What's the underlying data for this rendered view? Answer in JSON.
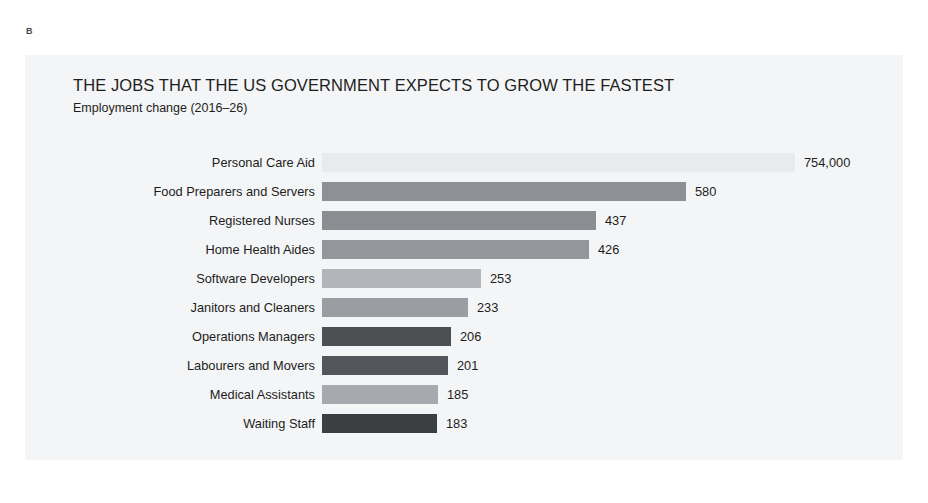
{
  "figure": {
    "letter": "B"
  },
  "chart_data": {
    "type": "bar",
    "orientation": "horizontal",
    "title": "THE JOBS THAT THE US GOVERNMENT EXPECTS TO GROW THE FASTEST",
    "subtitle": "Employment change (2016–26)",
    "xlabel": "",
    "ylabel": "",
    "grid": false,
    "legend": "none",
    "value_unit": "thousands of jobs",
    "xlim": [
      0,
      754
    ],
    "categories": [
      "Personal Care Aid",
      "Food Preparers and Servers",
      "Registered Nurses",
      "Home Health Aides",
      "Software Developers",
      "Janitors and Cleaners",
      "Operations Managers",
      "Labourers and Movers",
      "Medical Assistants",
      "Waiting Staff"
    ],
    "values": [
      754,
      580,
      437,
      426,
      253,
      233,
      206,
      201,
      185,
      183
    ],
    "value_labels": [
      "754,000",
      "580",
      "437",
      "426",
      "253",
      "233",
      "206",
      "201",
      "185",
      "183"
    ],
    "bar_colors": [
      "#e9eaec",
      "#8d9094",
      "#8a8d91",
      "#93969a",
      "#b2b5b9",
      "#9a9da1",
      "#4d5053",
      "#53565a",
      "#a6a9ad",
      "#3c3f42"
    ],
    "background_color": "#f4f5f6",
    "text_color": "#1d1d1d"
  }
}
